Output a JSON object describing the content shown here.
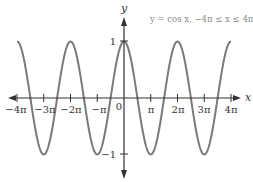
{
  "chart_data": {
    "type": "line",
    "title": "y = cos x, −4π ≤ x ≤ 4π",
    "xlabel": "x",
    "ylabel": "y",
    "function": "cos(x)",
    "domain": [
      -12.566,
      12.566
    ],
    "xlim": [
      -12.566,
      12.566
    ],
    "ylim": [
      -1,
      1
    ],
    "grid": false,
    "legend": "none",
    "x_ticks": [
      "−4π",
      "−3π",
      "−2π",
      "−π",
      "0",
      "π",
      "2π",
      "3π",
      "4π"
    ],
    "x_tick_values": [
      -12.566,
      -9.425,
      -6.283,
      -3.142,
      0,
      3.142,
      6.283,
      9.425,
      12.566
    ],
    "y_ticks": [
      "1",
      "−1"
    ],
    "y_tick_values": [
      1,
      -1
    ],
    "series": [
      {
        "name": "y = cos x",
        "color": "#7a7a7a",
        "x": [
          -12.566,
          -9.425,
          -6.283,
          -3.142,
          0,
          3.142,
          6.283,
          9.425,
          12.566
        ],
        "y": [
          1,
          -1,
          1,
          -1,
          1,
          -1,
          1,
          -1,
          1
        ]
      }
    ]
  },
  "labels": {
    "title": "y = cos x, −4π ≤ x ≤ 4π",
    "x_axis": "x",
    "y_axis": "y",
    "origin": "0",
    "y_pos_one": "1",
    "y_neg_one": "−1",
    "x_ticks": [
      "−4π",
      "−3π",
      "−2π",
      "−π",
      "π",
      "2π",
      "3π",
      "4π"
    ]
  },
  "colors": {
    "curve": "#7a7a7a",
    "axis": "#333333",
    "title": "#8a8a8a"
  }
}
